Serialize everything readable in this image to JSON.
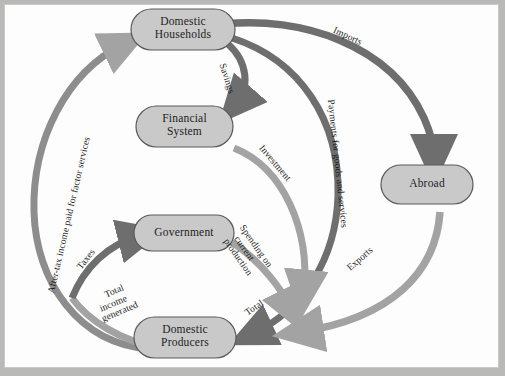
{
  "diagram": {
    "background_color": "#b9b9b7",
    "sheet_color": "#fdfdfd",
    "node_fill": "#c9c9c9",
    "node_stroke": "#5a5a5a",
    "arrow_dark": "#6e6e6e",
    "arrow_light": "#a3a3a3",
    "text_color": "#1d1d1d"
  },
  "nodes": [
    {
      "id": "domestic-households",
      "label_line1": "Domestic",
      "label_line2": "Households"
    },
    {
      "id": "financial-system",
      "label_line1": "Financial",
      "label_line2": "System"
    },
    {
      "id": "government",
      "label_line1": "Government",
      "label_line2": ""
    },
    {
      "id": "domestic-producers",
      "label_line1": "Domestic",
      "label_line2": "Producers"
    },
    {
      "id": "abroad",
      "label_line1": "Abroad",
      "label_line2": ""
    }
  ],
  "flows": [
    {
      "id": "after-tax-income",
      "text": "After-tax income paid for factor services",
      "from": "domestic-producers",
      "to": "domestic-households",
      "tone": "light"
    },
    {
      "id": "savings",
      "text": "Savings",
      "from": "domestic-households",
      "to": "financial-system",
      "tone": "dark"
    },
    {
      "id": "investment",
      "text": "Investment",
      "from": "financial-system",
      "to": "domestic-producers",
      "tone": "light"
    },
    {
      "id": "imports",
      "text": "Imports",
      "from": "domestic-households",
      "to": "abroad",
      "tone": "dark"
    },
    {
      "id": "payments-goods",
      "text": "Payments for goods and services",
      "from": "domestic-households",
      "to": "domestic-producers",
      "tone": "dark"
    },
    {
      "id": "exports",
      "text": "Exports",
      "from": "abroad",
      "to": "domestic-producers",
      "tone": "light"
    },
    {
      "id": "taxes",
      "text": "Taxes",
      "from": "domestic-producers",
      "to": "government",
      "tone": "dark"
    },
    {
      "id": "spending-current-production",
      "line1": "Spending on",
      "line2": "current",
      "line3": "production",
      "from": "government",
      "to": "domestic-producers",
      "tone": "light"
    },
    {
      "id": "total-income-generated",
      "line1": "Total",
      "line2": "income",
      "line3": "generated",
      "from": "domestic-producers",
      "to": "after-tax-income-path",
      "tone": "light"
    },
    {
      "id": "total-inflow",
      "text": "Total",
      "to": "domestic-producers",
      "tone": "dark"
    }
  ]
}
